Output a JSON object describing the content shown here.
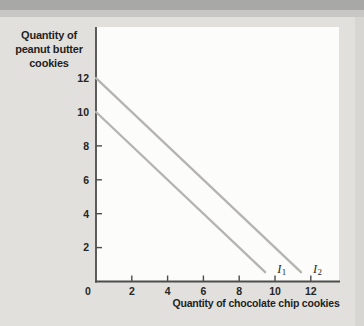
{
  "figure": {
    "bg_color": "#e1e0dd",
    "top_band_color": "#a8a8a6",
    "top_band2_color": "#c8c7c4",
    "plot_bg": "#fcfcfa"
  },
  "chart_data": {
    "type": "line",
    "subtype": "indifference-curves",
    "title": "",
    "xlabel": "Quantity of chocolate chip cookies",
    "ylabel_lines": [
      "Quantity of",
      "peanut butter",
      "cookies"
    ],
    "xlim": [
      0,
      13.5
    ],
    "ylim": [
      0,
      15
    ],
    "grid": false,
    "legend": "none",
    "x_ticks": [
      0,
      2,
      4,
      6,
      8,
      10,
      12
    ],
    "y_ticks": [
      2,
      4,
      6,
      8,
      10,
      12
    ],
    "axis_color": "#4c4c4a",
    "tick_label_color": "#262624",
    "curve_label_color": "#2a2a28",
    "series": [
      {
        "name": "I1",
        "label_base": "I",
        "label_sub": "1",
        "color": "#b5b4b1",
        "points": [
          [
            0,
            10
          ],
          [
            10,
            0
          ]
        ]
      },
      {
        "name": "I2",
        "label_base": "I",
        "label_sub": "2",
        "color": "#b5b4b1",
        "points": [
          [
            0,
            12
          ],
          [
            12,
            0
          ]
        ]
      }
    ]
  }
}
